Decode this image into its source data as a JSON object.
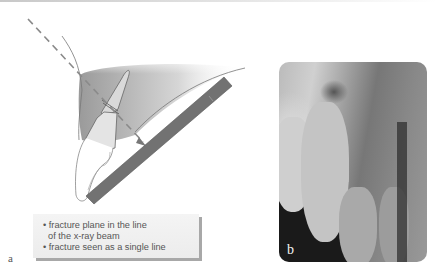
{
  "panel_a": {
    "label": "a",
    "caption": {
      "items": [
        "• fracture plane in the line",
        "  of the x-ray beam",
        "• fracture seen as a single line"
      ]
    },
    "colors": {
      "beam": "#8a8a8a",
      "film": "#6e6e6e",
      "tissue_shading": "#b8b8b8",
      "outline": "#777777"
    }
  },
  "panel_b": {
    "label": "b",
    "description": "periapical radiograph of maxillary incisors"
  }
}
